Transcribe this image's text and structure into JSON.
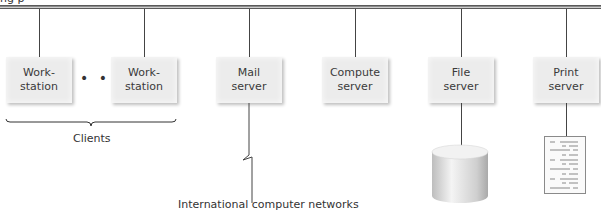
{
  "diagram": {
    "top_fragment": "ng p",
    "bus": {
      "name": "network-bus",
      "color": "#8c8c8c"
    },
    "nodes": [
      {
        "id": "workstation-1",
        "label": "Work-\nstation",
        "x": 6,
        "drop_x": 39
      },
      {
        "id": "workstation-2",
        "label": "Work-\nstation",
        "x": 111,
        "drop_x": 144
      },
      {
        "id": "mail-server",
        "label": "Mail\nserver",
        "x": 216,
        "drop_x": 249
      },
      {
        "id": "compute-server",
        "label": "Compute\nserver",
        "x": 322,
        "drop_x": 355
      },
      {
        "id": "file-server",
        "label": "File\nserver",
        "x": 428,
        "drop_x": 461
      },
      {
        "id": "print-server",
        "label": "Print\nserver",
        "x": 533,
        "drop_x": 566
      }
    ],
    "ellipsis": "• • •",
    "clients_label": "Clients",
    "network_label": "International computer networks",
    "icons": {
      "storage": "disk-cylinder",
      "document": "printed-page"
    }
  }
}
